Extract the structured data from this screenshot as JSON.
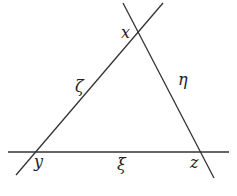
{
  "diagram": {
    "type": "triangle formed by three intersecting lines",
    "line_color": "#333333",
    "background": "#ffffff",
    "lines": [
      {
        "name": "line-zeta",
        "label": "ζ",
        "x1": 16,
        "y1": 175,
        "x2": 163,
        "y2": 3
      },
      {
        "name": "line-eta",
        "label": "η",
        "x1": 123,
        "y1": 3,
        "x2": 214,
        "y2": 178
      },
      {
        "name": "line-xi",
        "label": "ξ",
        "x1": 8,
        "y1": 152,
        "x2": 229,
        "y2": 152
      }
    ],
    "vertices": [
      {
        "name": "x",
        "label": "x",
        "lx": 121,
        "ly": 38
      },
      {
        "name": "y",
        "label": "y",
        "lx": 34,
        "ly": 167
      },
      {
        "name": "z",
        "label": "z",
        "lx": 190,
        "ly": 168
      }
    ],
    "line_labels": [
      {
        "name": "zeta",
        "label": "ζ",
        "lx": 75,
        "ly": 92
      },
      {
        "name": "eta",
        "label": "η",
        "lx": 178,
        "ly": 85
      },
      {
        "name": "xi",
        "label": "ξ",
        "lx": 117,
        "ly": 170
      }
    ]
  }
}
